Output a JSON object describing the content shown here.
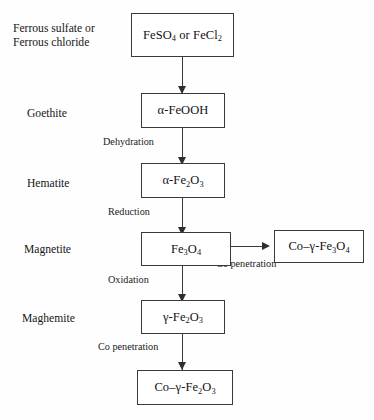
{
  "diagram": {
    "background_color": "#fefefe",
    "line_color": "#3a3a3a",
    "text_color": "#121212"
  },
  "phases": [
    {
      "id": "phase-precursor",
      "line1": "Ferrous sulfate or",
      "line2": "Ferrous chloride"
    },
    {
      "id": "phase-goethite",
      "line1": "Goethite",
      "line2": ""
    },
    {
      "id": "phase-hematite",
      "line1": "Hematite",
      "line2": ""
    },
    {
      "id": "phase-magnetite",
      "line1": "Magnetite",
      "line2": ""
    },
    {
      "id": "phase-maghemite",
      "line1": "Maghemite",
      "line2": ""
    }
  ],
  "nodes": {
    "precursor": {
      "label": "FeSO4 or FeCl2",
      "parts": [
        "FeSO",
        "4",
        " or FeCl",
        "2",
        ""
      ]
    },
    "goethite": {
      "label": "alpha-FeOOH",
      "prefix": "α-FeOOH"
    },
    "hematite": {
      "label": "alpha-Fe2O3",
      "p1": "α-Fe",
      "s1": "2",
      "p2": "O",
      "s2": "3"
    },
    "magnetite": {
      "label": "Fe3O4",
      "p1": "Fe",
      "s1": "3",
      "p2": "O",
      "s2": "4"
    },
    "maghemite": {
      "label": "gamma-Fe2O3",
      "p1": "γ-Fe",
      "s1": "2",
      "p2": "O",
      "s2": "3"
    },
    "co_magnetite": {
      "label": "Co-gamma-Fe3O4",
      "p1": "Co–γ-Fe",
      "s1": "3",
      "p2": "O",
      "s2": "4"
    },
    "co_maghemite": {
      "label": "Co-gamma-Fe2O3",
      "p1": "Co–γ-Fe",
      "s1": "2",
      "p2": "O",
      "s2": "3"
    }
  },
  "edges": [
    {
      "id": "edge-precursor-goethite",
      "label": ""
    },
    {
      "id": "edge-goethite-hematite",
      "label": "Dehydration"
    },
    {
      "id": "edge-hematite-magnetite",
      "label": "Reduction"
    },
    {
      "id": "edge-magnetite-maghemite",
      "label": "Oxidation"
    },
    {
      "id": "edge-magnetite-comagnetite",
      "label": "Co penetration"
    },
    {
      "id": "edge-maghemite-comaghemite",
      "label": "Co penetration"
    }
  ]
}
